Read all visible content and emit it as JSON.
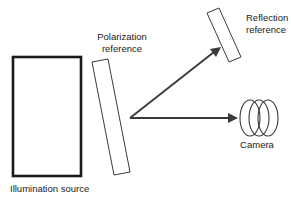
{
  "diagram": {
    "type": "optical-setup-schematic",
    "background_color": "#ffffff",
    "line_color": "#3a3a3a",
    "text_color": "#1a1a1a",
    "labels": {
      "illumination_source": "Illumination source",
      "polarization_reference_line1": "Polarization",
      "polarization_reference_line2": "reference",
      "reflection_reference_line1": "Reflection",
      "reflection_reference_line2": "reference",
      "camera": "Camera"
    },
    "components": [
      {
        "name": "illumination-source",
        "shape": "rectangle",
        "x": 13,
        "y": 57,
        "width": 68,
        "height": 119,
        "stroke_width": 2.6
      },
      {
        "name": "polarization-reference",
        "shape": "tilted-slab",
        "points": "92,62 108,59 130,172 114,175"
      },
      {
        "name": "reflection-reference",
        "shape": "tilted-slab",
        "points": "207,13 219,8 241,57 229,62"
      },
      {
        "name": "camera",
        "shape": "three-overlapping-ellipses",
        "ellipses": [
          {
            "cx": 250,
            "cy": 118,
            "rx": 10,
            "ry": 18
          },
          {
            "cx": 259,
            "cy": 118,
            "rx": 10,
            "ry": 18
          },
          {
            "cx": 268,
            "cy": 118,
            "rx": 10,
            "ry": 18
          }
        ]
      }
    ],
    "beams": [
      {
        "name": "reflected-beam",
        "from": [
          130,
          118
        ],
        "to": [
          219,
          48
        ],
        "arrow": true,
        "direction": "up-right"
      },
      {
        "name": "transmitted-beam",
        "from": [
          130,
          118
        ],
        "to": [
          238,
          118
        ],
        "arrow": true,
        "direction": "right"
      }
    ]
  }
}
